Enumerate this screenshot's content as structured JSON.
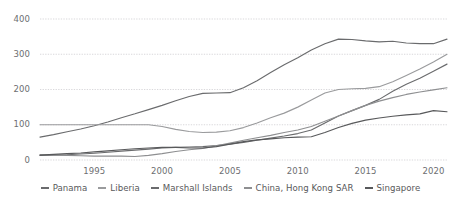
{
  "chart_data": {
    "type": "line",
    "title": "",
    "subtitle": "",
    "xlabel": "",
    "ylabel": "",
    "xlim": [
      1991,
      2021
    ],
    "ylim": [
      0,
      400
    ],
    "grid": true,
    "grid_axis": "y",
    "legend_position": "bottom",
    "x_ticks": [
      "1995",
      "2000",
      "2005",
      "2010",
      "2015",
      "2020"
    ],
    "x_tick_values": [
      1995,
      2000,
      2005,
      2010,
      2015,
      2020
    ],
    "y_ticks": [
      "0",
      "100",
      "200",
      "300",
      "400"
    ],
    "y_tick_values": [
      0,
      100,
      200,
      300,
      400
    ],
    "x": [
      1991,
      1992,
      1993,
      1994,
      1995,
      1996,
      1997,
      1998,
      1999,
      2000,
      2001,
      2002,
      2003,
      2004,
      2005,
      2006,
      2007,
      2008,
      2009,
      2010,
      2011,
      2012,
      2013,
      2014,
      2015,
      2016,
      2017,
      2018,
      2019,
      2020,
      2021
    ],
    "series": [
      {
        "name": "Panama",
        "color": "#6a6b6d",
        "values": [
          65,
          72,
          80,
          88,
          97,
          108,
          120,
          131,
          143,
          155,
          168,
          180,
          189,
          190,
          191,
          205,
          225,
          248,
          270,
          290,
          312,
          330,
          343,
          342,
          338,
          335,
          337,
          332,
          330,
          330,
          343
        ]
      },
      {
        "name": "Liberia",
        "color": "#9a9b9d",
        "values": [
          100,
          100,
          100,
          100,
          100,
          100,
          100,
          100,
          100,
          95,
          87,
          81,
          78,
          79,
          83,
          92,
          105,
          120,
          133,
          150,
          170,
          190,
          200,
          202,
          203,
          208,
          222,
          240,
          258,
          278,
          300
        ]
      },
      {
        "name": "Marshall Islands",
        "color": "#6a6b6d",
        "values": [
          13,
          14,
          15,
          17,
          19,
          22,
          25,
          28,
          31,
          34,
          36,
          37,
          38,
          41,
          45,
          50,
          56,
          62,
          68,
          75,
          85,
          105,
          125,
          140,
          155,
          172,
          195,
          215,
          232,
          252,
          272
        ]
      },
      {
        "name": "China, Hong Kong SAR",
        "color": "#8e8f91",
        "values": [
          15,
          14,
          13,
          12,
          11,
          11,
          11,
          10,
          13,
          18,
          24,
          29,
          33,
          40,
          48,
          56,
          63,
          70,
          78,
          85,
          95,
          110,
          125,
          140,
          155,
          167,
          177,
          186,
          193,
          199,
          205
        ]
      },
      {
        "name": "Singapore",
        "color": "#58595b",
        "values": [
          14,
          16,
          18,
          20,
          23,
          26,
          29,
          32,
          34,
          36,
          36,
          34,
          34,
          38,
          45,
          52,
          57,
          60,
          63,
          65,
          66,
          78,
          92,
          104,
          113,
          119,
          124,
          128,
          131,
          140,
          137
        ]
      }
    ]
  },
  "legend": {
    "items": [
      {
        "label": "Panama"
      },
      {
        "label": "Liberia"
      },
      {
        "label": "Marshall Islands"
      },
      {
        "label": "China, Hong Kong SAR"
      },
      {
        "label": "Singapore"
      }
    ]
  }
}
